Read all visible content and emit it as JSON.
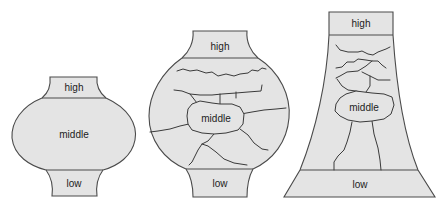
{
  "colors": {
    "fill": "#e4e4e4",
    "stroke": "#4a4a4a",
    "background": "#ffffff"
  },
  "diagrams": [
    {
      "id": "vessel-1",
      "labels": {
        "top": "high",
        "center": "middle",
        "bottom": "low"
      }
    },
    {
      "id": "vessel-2",
      "labels": {
        "top": "high",
        "center": "middle",
        "bottom": "low"
      }
    },
    {
      "id": "vessel-3",
      "labels": {
        "top": "high",
        "center": "middle",
        "bottom": "low"
      }
    }
  ]
}
